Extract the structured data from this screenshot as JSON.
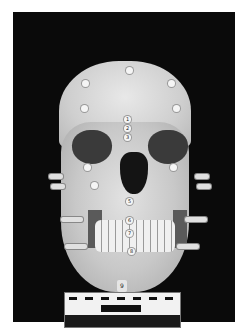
{
  "photo": {
    "subject": "skull with tissue-depth markers",
    "background_color": "#0a0a0a",
    "midline_markers": [
      "1",
      "2",
      "3",
      "5",
      "6",
      "7",
      "8",
      "9"
    ],
    "scale": {
      "has_ruler": true
    }
  }
}
